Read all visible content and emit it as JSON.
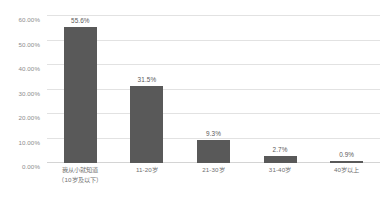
{
  "chart_data": {
    "type": "bar",
    "title": "",
    "subtitle": "",
    "xlabel": "",
    "ylabel": "",
    "categories": [
      "我从小就知道（10岁及以下）",
      "11-20岁",
      "21-30岁",
      "31-40岁",
      "40岁以上"
    ],
    "category_lines": [
      [
        "我从小就知道",
        "（10岁及以下）"
      ],
      [
        "11-20岁"
      ],
      [
        "21-30岁"
      ],
      [
        "31-40岁"
      ],
      [
        "40岁以上"
      ]
    ],
    "values": [
      55.6,
      31.5,
      9.3,
      2.7,
      0.9
    ],
    "value_labels": [
      "55.6%",
      "31.5%",
      "9.3%",
      "2.7%",
      "0.9%"
    ],
    "ylim": [
      0,
      60
    ],
    "ytick_values": [
      0,
      10,
      20,
      30,
      40,
      50,
      60
    ],
    "ytick_labels": [
      "0.00%",
      "10.00%",
      "20.00%",
      "30.00%",
      "40.00%",
      "50.00%",
      "60.00%"
    ],
    "grid": true,
    "legend": false,
    "legend_position": "none",
    "colors": {
      "bar": "#595959",
      "gridline": "#e2e2e2",
      "baseline": "#d4d4d4",
      "tick_label": "#8c8c8c",
      "value_label": "#5a5a5a",
      "category_label": "#6f6f6f",
      "background": "#ffffff"
    }
  }
}
